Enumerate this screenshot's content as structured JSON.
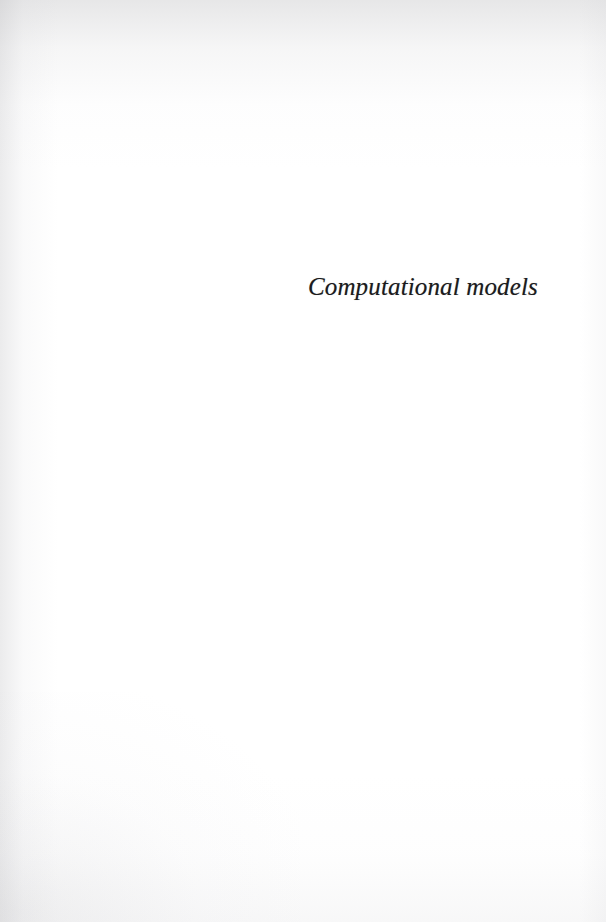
{
  "document": {
    "kind": "scanned-book-part-title-page",
    "page_width": 606,
    "page_height": 922,
    "background_color": "#ffffff",
    "ink_color": "#1b1b1d"
  },
  "part_title": {
    "text": "Computational models",
    "alignment": "right",
    "style": "italic-serif"
  }
}
